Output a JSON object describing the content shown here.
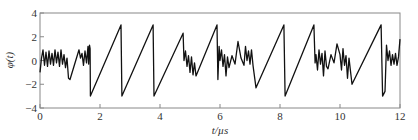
{
  "chart_data": {
    "type": "line",
    "title": "",
    "xlabel": "t/µs",
    "ylabel": "φ(t)",
    "xlim": [
      0,
      12
    ],
    "ylim": [
      -4,
      4
    ],
    "xticks": [
      0,
      2,
      4,
      6,
      8,
      10,
      12
    ],
    "yticks": [
      -4,
      -2,
      0,
      2,
      4
    ],
    "xtick_labels": [
      "0",
      "2",
      "4",
      "6",
      "8",
      "10",
      "12"
    ],
    "ytick_labels": [
      "−4",
      "−2",
      "0",
      "2",
      "4"
    ],
    "grid": false,
    "legend": null,
    "series": [
      {
        "name": "phi(t)",
        "x": [
          0,
          0.05,
          0.1,
          0.15,
          0.2,
          0.25,
          0.3,
          0.35,
          0.4,
          0.45,
          0.5,
          0.55,
          0.6,
          0.65,
          0.7,
          0.75,
          0.8,
          0.85,
          0.9,
          0.95,
          1.0,
          1.3,
          1.35,
          1.4,
          1.45,
          1.5,
          1.55,
          1.6,
          1.62,
          1.65,
          1.67,
          1.68,
          2.7,
          2.73,
          3.77,
          3.8,
          4.77,
          4.8,
          4.85,
          4.9,
          4.95,
          5.0,
          5.05,
          5.1,
          5.15,
          5.2,
          5.9,
          5.93,
          5.97,
          6.0,
          6.05,
          6.1,
          6.15,
          6.2,
          6.25,
          6.3,
          6.4,
          6.5,
          6.6,
          6.7,
          6.8,
          6.85,
          6.9,
          6.95,
          7.0,
          7.05,
          7.1,
          7.2,
          8.13,
          8.17,
          9.13,
          9.17,
          9.2,
          9.25,
          9.3,
          9.35,
          9.4,
          9.45,
          9.5,
          9.55,
          9.6,
          9.7,
          9.8,
          9.9,
          10.0,
          10.05,
          10.1,
          10.15,
          10.2,
          10.25,
          10.3,
          10.4,
          11.37,
          11.42,
          11.5,
          11.55,
          11.6,
          11.65,
          11.7,
          11.75,
          11.8,
          11.85,
          11.9,
          11.95,
          12.0
        ],
        "y": [
          -1.0,
          0.2,
          0.9,
          -0.4,
          0.7,
          -0.5,
          0.8,
          -0.3,
          0.6,
          -0.4,
          0.9,
          -0.2,
          0.7,
          -0.5,
          0.9,
          -0.3,
          0.5,
          -0.6,
          0.2,
          -1.5,
          -1.6,
          0.9,
          0.2,
          0.6,
          -0.4,
          0.8,
          -0.2,
          1.2,
          -0.3,
          1.3,
          1.0,
          -3.0,
          3.0,
          -3.0,
          3.0,
          -3.0,
          2.3,
          0.0,
          0.8,
          -0.5,
          0.4,
          -1.0,
          0.3,
          -1.2,
          -0.2,
          -1.3,
          3.0,
          -1.6,
          1.2,
          0.0,
          0.9,
          -0.5,
          0.5,
          -1.3,
          0.3,
          -0.6,
          0.4,
          -0.3,
          1.6,
          0.2,
          -0.4,
          1.2,
          0.0,
          0.8,
          -0.3,
          0.9,
          -0.4,
          -2.3,
          3.0,
          -3.0,
          3.0,
          -0.2,
          0.5,
          -0.8,
          0.9,
          -0.3,
          0.6,
          -1.3,
          0.8,
          -0.5,
          -0.7,
          0.5,
          -0.2,
          1.4,
          0.5,
          -0.8,
          1.0,
          -0.4,
          0.4,
          -1.5,
          0.2,
          -2.0,
          3.0,
          -3.0,
          -2.6,
          1.3,
          0.0,
          0.8,
          -0.4,
          0.5,
          -0.3,
          0.6,
          -0.4,
          0.3,
          1.8
        ]
      }
    ]
  }
}
